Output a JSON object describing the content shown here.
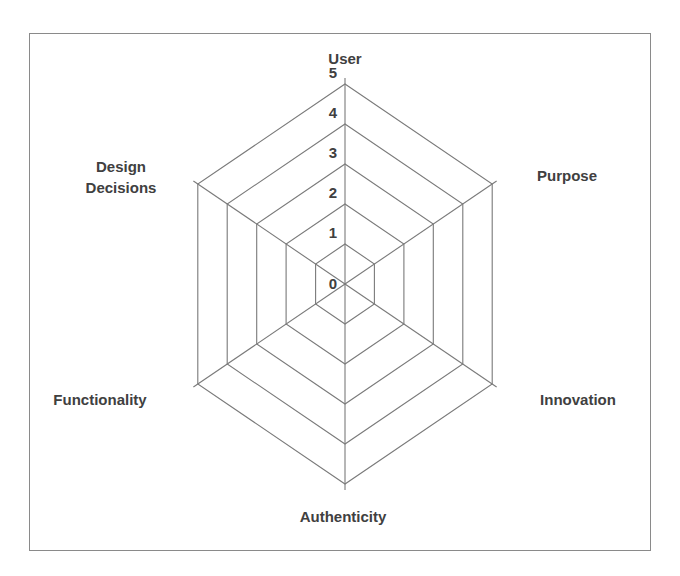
{
  "chart_data": {
    "type": "radar",
    "title": "",
    "axes": [
      "User",
      "Purpose",
      "Innovation",
      "Authenticity",
      "Functionality",
      "Design Decisions"
    ],
    "axis_label_lines": [
      [
        "User"
      ],
      [
        "Purpose"
      ],
      [
        "Innovation"
      ],
      [
        "Authenticity"
      ],
      [
        "Functionality"
      ],
      [
        "Design",
        "Decisions"
      ]
    ],
    "scale": {
      "min": 0,
      "max": 5,
      "step": 1
    },
    "tick_labels": [
      "0",
      "1",
      "2",
      "3",
      "4",
      "5"
    ],
    "series": [],
    "grid": true,
    "legend": "none"
  },
  "colors": {
    "grid": "#7a7a7a",
    "text": "#404040",
    "frame": "#8a8a8a"
  }
}
